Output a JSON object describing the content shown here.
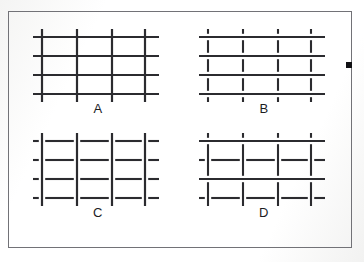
{
  "figure": {
    "background_color": "#fdfdfd",
    "frame_color": "#6f6f73",
    "line_color": "#2b2b2f",
    "label_color": "#1c1c1f",
    "marker_color": "#111114",
    "edge_marker_name": "black-square-edge-marker"
  },
  "panels": [
    {
      "id": "a",
      "label": "A",
      "description": "continuous vertical lines and continuous horizontal lines forming a full mesh",
      "vertical_count": 4,
      "horizontal_count": 4,
      "vertical_style": "continuous",
      "horizontal_style": "continuous",
      "vertical_x": [
        14,
        49,
        84,
        117
      ],
      "horizontal_y": [
        13,
        32,
        51,
        70
      ],
      "vertical_span": [
        5,
        78
      ],
      "horizontal_span": [
        5,
        131
      ]
    },
    {
      "id": "b",
      "label": "B",
      "description": "continuous horizontal lines with vertical lines broken into short segments between them",
      "vertical_count": 4,
      "horizontal_count": 4,
      "vertical_style": "broken",
      "horizontal_style": "continuous",
      "vertical_x": [
        14,
        49,
        84,
        117
      ],
      "horizontal_y": [
        13,
        32,
        51,
        70
      ],
      "vertical_span": [
        5,
        78
      ],
      "horizontal_span": [
        5,
        131
      ]
    },
    {
      "id": "c",
      "label": "C",
      "description": "continuous vertical lines with horizontal lines broken into short segments between them",
      "vertical_count": 4,
      "horizontal_count": 4,
      "vertical_style": "continuous",
      "horizontal_style": "broken",
      "vertical_x": [
        14,
        49,
        84,
        117
      ],
      "horizontal_y": [
        13,
        32,
        51,
        70
      ],
      "vertical_span": [
        5,
        78
      ],
      "horizontal_span": [
        5,
        131
      ]
    },
    {
      "id": "d",
      "label": "D",
      "description": "mixed mesh: horizontal rows 1 and 3 continuous, horizontal rows 2 and 4 broken, vertical lines broken across the continuous rows",
      "vertical_count": 4,
      "horizontal_count": 4,
      "vertical_style": "mixed",
      "horizontal_style": "mixed",
      "continuous_horizontal_rows": [
        1,
        3
      ],
      "broken_horizontal_rows": [
        2,
        4
      ],
      "vertical_x": [
        14,
        49,
        84,
        117
      ],
      "horizontal_y": [
        13,
        32,
        51,
        70
      ],
      "vertical_span": [
        5,
        78
      ],
      "horizontal_span": [
        5,
        131
      ]
    }
  ]
}
